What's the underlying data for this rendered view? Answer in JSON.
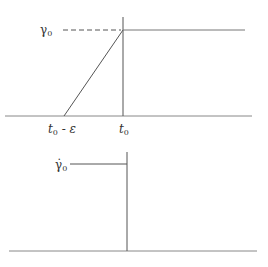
{
  "diagram": {
    "type": "strain-history",
    "top_plot": {
      "description": "Strain gamma vs time: linear ramp from t0-epsilon to t0, then constant gamma0",
      "y_label": {
        "symbol": "γ",
        "subscript": "0"
      },
      "x_labels": [
        {
          "base": "t",
          "subscript": "0",
          "suffix": " - ε"
        },
        {
          "base": "t",
          "subscript": "0",
          "suffix": ""
        }
      ]
    },
    "bottom_plot": {
      "description": "Strain rate: constant gamma-dot0 before t0, drops to zero at t0",
      "y_label": {
        "symbol": "γ̇",
        "subscript": "0"
      }
    },
    "line_color": "#555555"
  }
}
